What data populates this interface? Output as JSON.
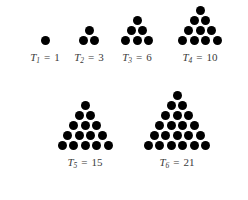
{
  "figure": {
    "background_color": "#ffffff",
    "dot_color": "#000000",
    "label_color": "#3a3a3a",
    "dot_diameter": 9,
    "row_spacing": 10,
    "column_spacing": 11.5,
    "caption_font_size": 11
  },
  "chart_data": {
    "type": "diagram",
    "xlabel": "",
    "ylabel": "",
    "categories": [
      "T_1",
      "T_2",
      "T_3",
      "T_4",
      "T_5",
      "T_6"
    ],
    "values": [
      1,
      3,
      6,
      10,
      15,
      21
    ],
    "series": [
      {
        "name": "Triangular number value",
        "values": [
          1,
          3,
          6,
          10,
          15,
          21
        ]
      },
      {
        "name": "Number of dot rows",
        "values": [
          1,
          2,
          3,
          4,
          5,
          6
        ]
      }
    ],
    "annotations": [
      "T_1 = 1",
      "T_2 = 3",
      "T_3 = 6",
      "T_4 = 10",
      "T_5 = 15",
      "T_6 = 21"
    ],
    "legend": [],
    "grid": false
  },
  "triangles": [
    {
      "id": "t1",
      "rows": 1,
      "total_dots": 1,
      "symbol": "T",
      "subscript": "1",
      "equals": "=",
      "value": "1",
      "caption": "T1 = 1",
      "left": 14,
      "top": 36,
      "width": 62,
      "caption_top": 24
    },
    {
      "id": "t2",
      "rows": 2,
      "total_dots": 3,
      "symbol": "T",
      "subscript": "2",
      "equals": "=",
      "value": "3",
      "caption": "T2 = 3",
      "left": 61,
      "top": 26,
      "width": 56,
      "caption_top": 34
    },
    {
      "id": "t3",
      "rows": 3,
      "total_dots": 6,
      "symbol": "T",
      "subscript": "3",
      "equals": "=",
      "value": "6",
      "caption": "T3 = 6",
      "left": 106,
      "top": 16,
      "width": 62,
      "caption_top": 44
    },
    {
      "id": "t4",
      "rows": 4,
      "total_dots": 10,
      "symbol": "T",
      "subscript": "4",
      "equals": "=",
      "value": "10",
      "caption": "T4 = 10",
      "left": 163,
      "top": 6,
      "width": 74,
      "caption_top": 54
    },
    {
      "id": "t5",
      "rows": 5,
      "total_dots": 15,
      "symbol": "T",
      "subscript": "5",
      "equals": "=",
      "value": "15",
      "caption": "T5 = 15",
      "left": 39,
      "top": 101,
      "width": 92,
      "caption_top": 63
    },
    {
      "id": "t6",
      "rows": 6,
      "total_dots": 21,
      "symbol": "T",
      "subscript": "6",
      "equals": "=",
      "value": "21",
      "caption": "T6 = 21",
      "left": 128,
      "top": 91,
      "width": 98,
      "caption_top": 73
    }
  ]
}
